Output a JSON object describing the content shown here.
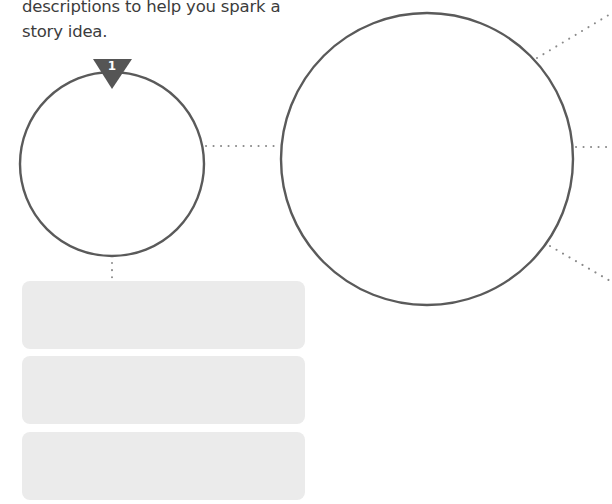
{
  "instructions": {
    "line1": "descriptions to help you spark a",
    "line2": "story idea."
  },
  "organizer": {
    "step_badge": "1",
    "small_circle": {
      "label": "",
      "cx": 112,
      "cy": 164,
      "r": 92
    },
    "large_circle": {
      "label": "",
      "cx": 427,
      "cy": 159,
      "r": 146
    },
    "answer_boxes": [
      {
        "value": ""
      },
      {
        "value": ""
      },
      {
        "value": ""
      }
    ]
  },
  "colors": {
    "stroke": "#5a5a5a",
    "dots": "#8a8a8a",
    "box_fill": "#ebebeb",
    "text": "#3c3c3c",
    "badge": "#555555"
  }
}
